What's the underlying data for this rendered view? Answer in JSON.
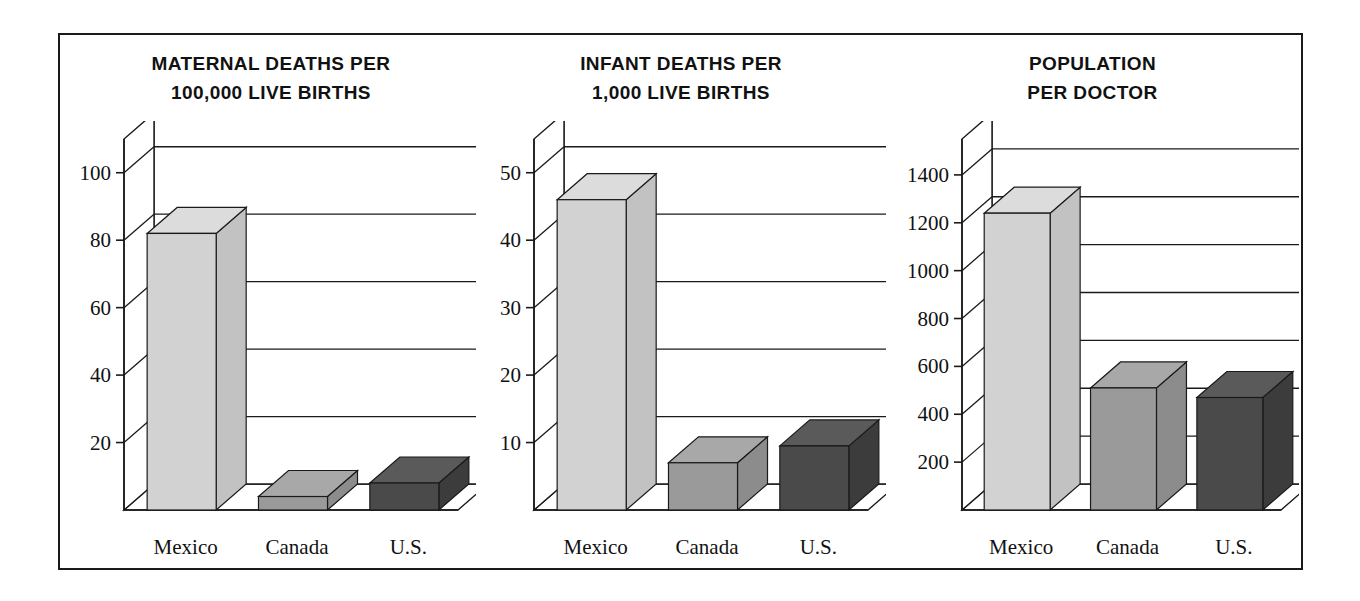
{
  "figure": {
    "background": "#ffffff",
    "border_color": "#1a1a1a"
  },
  "palette": {
    "mexico_face": "#d2d2d2",
    "mexico_top": "#dcdcdc",
    "mexico_side": "#c2c2c2",
    "canada_face": "#9a9a9a",
    "canada_top": "#a8a8a8",
    "canada_side": "#8c8c8c",
    "us_face": "#4a4a4a",
    "us_top": "#5a5a5a",
    "us_side": "#3c3c3c",
    "outline": "#1a1a1a",
    "gridline": "#1a1a1a"
  },
  "panels": [
    {
      "id": "maternal-deaths",
      "title_line1": "MATERNAL DEATHS PER",
      "title_line2": "100,000 LIVE BIRTHS",
      "chart_data": {
        "type": "bar",
        "title": "MATERNAL DEATHS PER 100,000 LIVE BIRTHS",
        "xlabel": "",
        "ylabel": "",
        "categories": [
          "Mexico",
          "Canada",
          "U.S."
        ],
        "values": [
          82,
          4,
          8
        ],
        "ylim": [
          0,
          110
        ],
        "yticks": [
          20,
          40,
          60,
          80,
          100
        ],
        "ytick_labels": [
          "20",
          "40",
          "60",
          "80",
          "100"
        ],
        "grid": true,
        "legend": "none",
        "projection": "3d-bar"
      }
    },
    {
      "id": "infant-deaths",
      "title_line1": "INFANT DEATHS PER",
      "title_line2": "1,000 LIVE BIRTHS",
      "chart_data": {
        "type": "bar",
        "title": "INFANT DEATHS PER 1,000 LIVE BIRTHS",
        "xlabel": "",
        "ylabel": "",
        "categories": [
          "Mexico",
          "Canada",
          "U.S."
        ],
        "values": [
          46,
          7,
          9.5
        ],
        "ylim": [
          0,
          55
        ],
        "yticks": [
          10,
          20,
          30,
          40,
          50
        ],
        "ytick_labels": [
          "10",
          "20",
          "30",
          "40",
          "50"
        ],
        "grid": true,
        "legend": "none",
        "projection": "3d-bar"
      }
    },
    {
      "id": "population-per-doctor",
      "title_line1": "POPULATION",
      "title_line2": "PER DOCTOR",
      "chart_data": {
        "type": "bar",
        "title": "POPULATION PER DOCTOR",
        "xlabel": "",
        "ylabel": "",
        "categories": [
          "Mexico",
          "Canada",
          "U.S."
        ],
        "values": [
          1240,
          510,
          470
        ],
        "ylim": [
          0,
          1550
        ],
        "yticks": [
          200,
          400,
          600,
          800,
          1000,
          1200,
          1400
        ],
        "ytick_labels": [
          "200",
          "400",
          "600",
          "800",
          "1000",
          "1200",
          "1400"
        ],
        "grid": true,
        "legend": "none",
        "projection": "3d-bar"
      }
    }
  ]
}
